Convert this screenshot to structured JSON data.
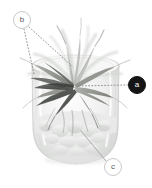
{
  "figure": {
    "width": 152,
    "height": 188,
    "background_color": "#ffffff",
    "photo": {
      "description": "Grayscale photograph of a rosette air plant (Tillandsia) with long arching strap leaves sitting in a clear glass cylinder vessel filled with pale pebbles",
      "vessel_color": "#d8dad9",
      "foliage_dark_color": "#4a4d4a",
      "foliage_mid_color": "#8d908c",
      "foliage_light_color": "#c4c7c3",
      "pebble_color": "#dfe0de"
    }
  },
  "callouts": [
    {
      "id": "a",
      "label": "a",
      "style": "filled",
      "fill_color": "#151515",
      "text_color": "#ffffff",
      "center_x": 137,
      "center_y": 85,
      "leader_style": "dotted",
      "leader_color": "#8a8a8a",
      "target_x": 74,
      "target_y": 86
    },
    {
      "id": "b",
      "label": "b",
      "style": "outlined",
      "fill_color": "#ffffff",
      "stroke_color": "#c9c9c9",
      "text_color": "#5a5a5a",
      "center_x": 22,
      "center_y": 20,
      "leader_style": "dotted",
      "leader_color": "#8a8a8a",
      "targets": [
        {
          "target_x": 34,
          "target_y": 74
        },
        {
          "target_x": 72,
          "target_y": 66
        }
      ]
    },
    {
      "id": "c",
      "label": "c",
      "style": "outlined",
      "fill_color": "#ffffff",
      "stroke_color": "#c9c9c9",
      "text_color": "#5a5a5a",
      "center_x": 113,
      "center_y": 167,
      "leader_style": "solid",
      "leader_color": "#9a9a9a",
      "target_x": 81,
      "target_y": 131
    }
  ]
}
